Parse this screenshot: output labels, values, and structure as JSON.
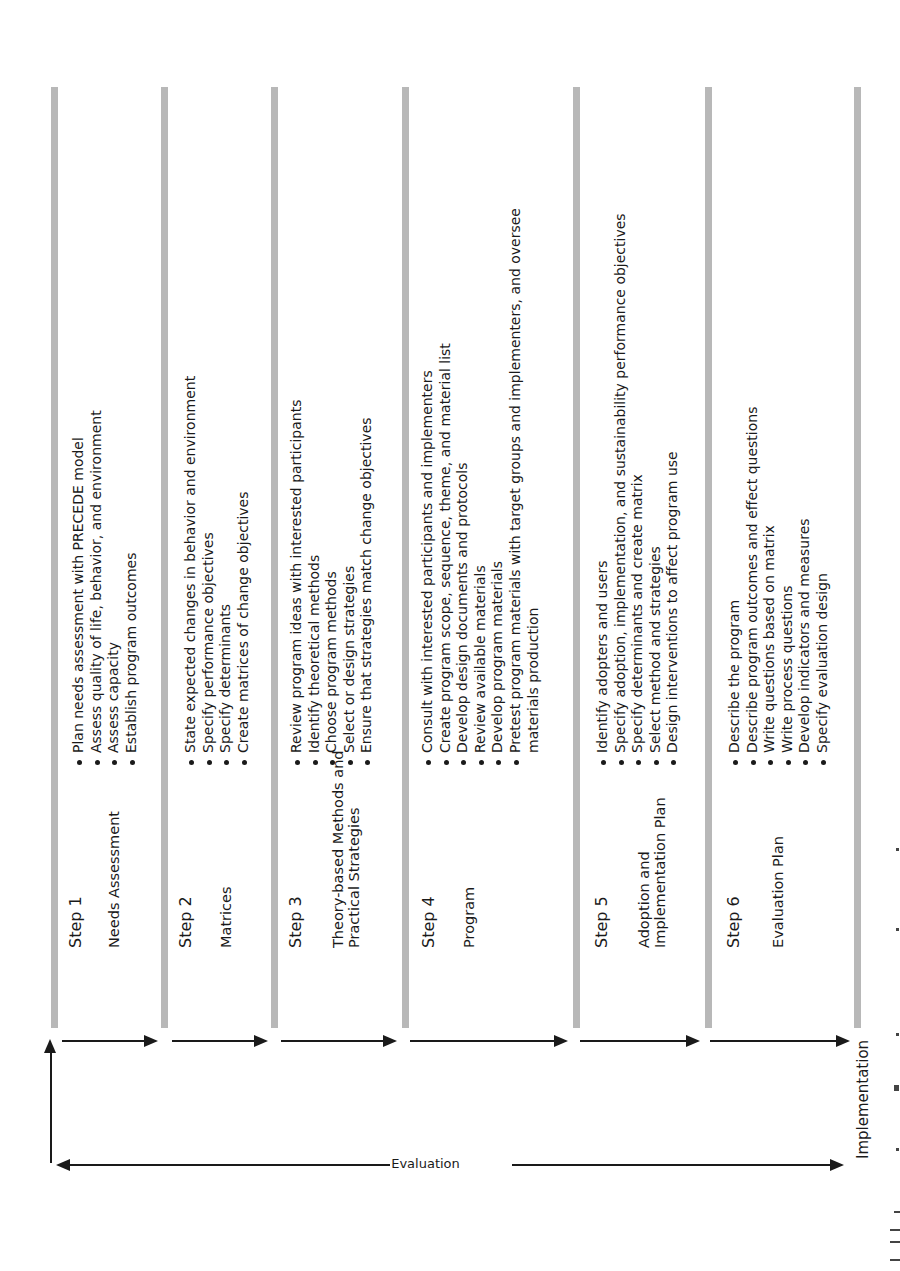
{
  "diagram": {
    "type": "process-flow",
    "orientation": "rotated-90-ccw",
    "bar_color": "#b8b8b8",
    "arrow_color": "#1a1a1a",
    "steps": [
      {
        "number": "Step 1",
        "title": "Needs Assessment",
        "tasks": [
          "Plan needs assessment with PRECEDE model",
          "Assess quality of life, behavior, and environment",
          "Assess capacity",
          "Establish program outcomes"
        ]
      },
      {
        "number": "Step 2",
        "title": "Matrices",
        "tasks": [
          "State expected changes in behavior and environment",
          "Specify performance objectives",
          "Specify determinants",
          "Create matrices of change objectives"
        ]
      },
      {
        "number": "Step 3",
        "title": "Theory-based Methods and\nPractical Strategies",
        "tasks": [
          "Review program ideas with interested participants",
          "Identify theoretical methods",
          "Choose program methods",
          "Select or design strategies",
          "Ensure that strategies match change objectives"
        ]
      },
      {
        "number": "Step 4",
        "title": "Program",
        "tasks": [
          "Consult with interested participants and implementers",
          "Create program scope, sequence, theme, and material list",
          "Develop design documents and protocols",
          "Review available materials",
          "Develop program materials",
          "Pretest program materials with target groups and implementers, and oversee\nmaterials production"
        ]
      },
      {
        "number": "Step 5",
        "title": "Adoption and\nImplementation Plan",
        "tasks": [
          "Identify adopters and users",
          "Specify adoption, implementation, and sustainability performance objectives",
          "Specify determinants and create matrix",
          "Select method and strategies",
          "Design interventions to affect program use"
        ]
      },
      {
        "number": "Step 6",
        "title": "Evaluation Plan",
        "tasks": [
          "Describe the program",
          "Describe program outcomes and effect questions",
          "Write questions based on matrix",
          "Write process questions",
          "Develop indicators and measures",
          "Specify evaluation design"
        ]
      }
    ],
    "feedback_label": "Evaluation",
    "end_label": "Implementation"
  }
}
